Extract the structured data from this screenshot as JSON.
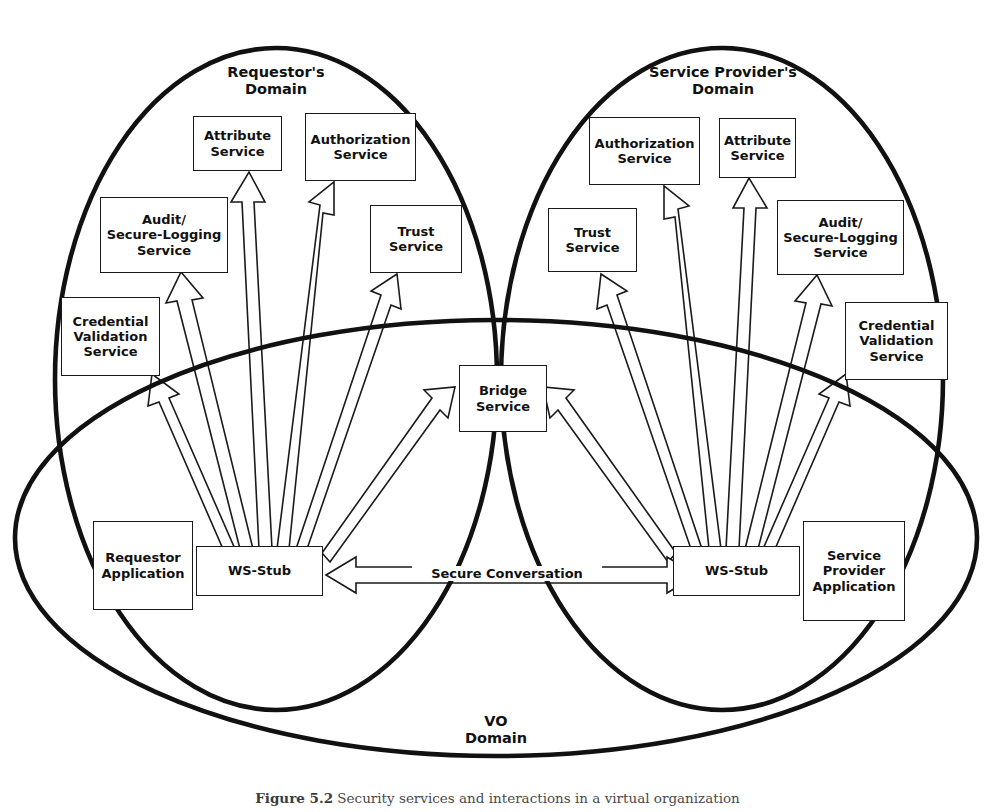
{
  "figure": {
    "caption_label": "Figure 5.2",
    "caption_text": "Security services and interactions in a virtual organization"
  },
  "domains": {
    "requestor": {
      "label": "Requestor's\nDomain"
    },
    "provider": {
      "label": "Service Provider's\nDomain"
    },
    "vo": {
      "label": "VO\nDomain"
    }
  },
  "colors": {
    "stroke": "#1a1a1a",
    "ellipse": "#111111",
    "arrow_fill": "#ffffff",
    "background": "#ffffff"
  },
  "nodes": {
    "left": {
      "attribute_service": "Attribute\nService",
      "authorization_service": "Authorization\nService",
      "audit_service": "Audit/\nSecure-Logging\nService",
      "trust_service": "Trust\nService",
      "credential_validation_service": "Credential\nValidation\nService",
      "ws_stub": "WS-Stub",
      "application": "Requestor\nApplication"
    },
    "center": {
      "bridge_service": "Bridge\nService"
    },
    "right": {
      "authorization_service": "Authorization\nService",
      "attribute_service": "Attribute\nService",
      "trust_service": "Trust\nService",
      "audit_service": "Audit/\nSecure-Logging\nService",
      "credential_validation_service": "Credential\nValidation\nService",
      "ws_stub": "WS-Stub",
      "application": "Service\nProvider\nApplication"
    }
  },
  "connections": {
    "secure_conversation": "Secure Conversation"
  },
  "geometry": {
    "requestor_ellipse": {
      "cx": 276,
      "cy": 379,
      "rx": 221,
      "ry": 331
    },
    "provider_ellipse": {
      "cx": 722,
      "cy": 379,
      "rx": 221,
      "ry": 331
    },
    "vo_ellipse": {
      "cx": 496,
      "cy": 538,
      "rx": 481,
      "ry": 218
    }
  }
}
